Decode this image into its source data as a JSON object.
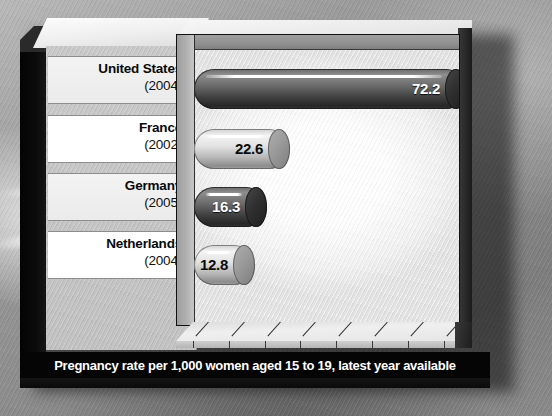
{
  "chart_data": {
    "type": "bar",
    "orientation": "horizontal",
    "title": "",
    "caption": "Pregnancy rate per 1,000 women aged 15 to 19, latest year available",
    "xlabel": "",
    "ylabel": "",
    "xlim": [
      0,
      80
    ],
    "xticks": [
      0,
      10,
      20,
      30,
      40,
      50,
      60,
      70,
      80
    ],
    "xtick_labels": [
      "0",
      "10",
      "20",
      "30",
      "40",
      "50",
      "60",
      "70",
      "80"
    ],
    "grid": false,
    "legend": "none",
    "categories": [
      "United States",
      "France",
      "Germany",
      "Netherlands"
    ],
    "values": [
      72.2,
      22.6,
      16.3,
      12.8
    ],
    "value_labels": [
      "72.2",
      "22.6",
      "16.3",
      "12.8"
    ],
    "years": [
      "(2004)",
      "(2002)",
      "(2005)",
      "(2004)"
    ],
    "bars": [
      {
        "country": "United States",
        "year": "(2004)",
        "value": 72.2,
        "label": "72.2",
        "style": "dark"
      },
      {
        "country": "France",
        "year": "(2002)",
        "value": 22.6,
        "label": "22.6",
        "style": "light"
      },
      {
        "country": "Germany",
        "year": "(2005)",
        "value": 16.3,
        "label": "16.3",
        "style": "dark"
      },
      {
        "country": "Netherlands",
        "year": "(2004)",
        "value": 12.8,
        "label": "12.8",
        "style": "light"
      }
    ],
    "colors": {
      "bar_dark": "#3e3e3e",
      "bar_light": "#d8d8d8",
      "caption_bg": "#050505",
      "caption_fg": "#ffffff",
      "plot_bg": "#ffffff",
      "label_panel_bg": "#c6c6c6"
    }
  }
}
